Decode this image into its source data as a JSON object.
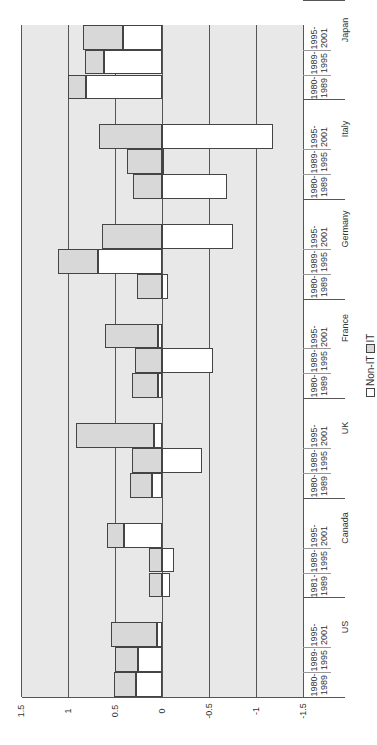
{
  "chart_data": {
    "type": "bar",
    "orientation": "rotated-90-ccw, stacked bars (horizontal on page)",
    "title": "",
    "xlabel": "",
    "ylabel": "",
    "ylim": [
      -1.5,
      1.5
    ],
    "ticks": [
      "1.5",
      "1",
      "0.5",
      "0",
      "-0.5",
      "-1",
      "-1.5"
    ],
    "tick_values": [
      1.5,
      1,
      0.5,
      0,
      -0.5,
      -1,
      -1.5
    ],
    "grid": true,
    "legend": {
      "position": "bottom",
      "entries": [
        "Non-IT",
        "IT"
      ]
    },
    "colors": {
      "Non-IT": "#ffffff",
      "IT": "#d8d8d8",
      "plot_bg": "#e8e8e8",
      "border": "#444444"
    },
    "groups": [
      {
        "country": "US",
        "periods": [
          "1980-1989",
          "1989-1995",
          "1995-2001"
        ]
      },
      {
        "country": "Canada",
        "periods": [
          "1981-1989",
          "1989-1995",
          "1995-2001"
        ]
      },
      {
        "country": "UK",
        "periods": [
          "1980-1989",
          "1989-1995",
          "1995-2001"
        ]
      },
      {
        "country": "France",
        "periods": [
          "1980-1989",
          "1989-1995",
          "1995-2001"
        ]
      },
      {
        "country": "Germany",
        "periods": [
          "1980-1989",
          "1989-1995",
          "1995-2001"
        ]
      },
      {
        "country": "Italy",
        "periods": [
          "1980-1989",
          "1989-1995",
          "1995-2001"
        ]
      },
      {
        "country": "Japan",
        "periods": [
          "1980-1989",
          "1989-1995",
          "1995-2001"
        ]
      }
    ],
    "categories": [
      "US 1980-1989",
      "US 1989-1995",
      "US 1995-2001",
      "Canada 1981-1989",
      "Canada 1989-1995",
      "Canada 1995-2001",
      "UK 1980-1989",
      "UK 1989-1995",
      "UK 1995-2001",
      "France 1980-1989",
      "France 1989-1995",
      "France 1995-2001",
      "Germany 1980-1989",
      "Germany 1989-1995",
      "Germany 1995-2001",
      "Italy 1980-1989",
      "Italy 1989-1995",
      "Italy 1995-2001",
      "Japan 1980-1989",
      "Japan 1989-1995",
      "Japan 1995-2001"
    ],
    "series": [
      {
        "name": "Non-IT",
        "values": [
          0.28,
          0.26,
          0.05,
          -0.09,
          -0.13,
          0.4,
          0.11,
          -0.43,
          0.09,
          0.04,
          -0.54,
          0.04,
          -0.06,
          0.68,
          -0.76,
          -0.69,
          -0.02,
          -1.18,
          0.81,
          0.62,
          0.42
        ]
      },
      {
        "name": "IT",
        "values": [
          0.23,
          0.24,
          0.49,
          0.14,
          0.14,
          0.18,
          0.23,
          0.32,
          0.82,
          0.28,
          0.29,
          0.57,
          0.27,
          0.43,
          0.64,
          0.31,
          0.37,
          0.67,
          0.19,
          0.2,
          0.42
        ]
      }
    ]
  },
  "legend": {
    "non_it_label": "Non-IT",
    "it_label": "IT"
  }
}
